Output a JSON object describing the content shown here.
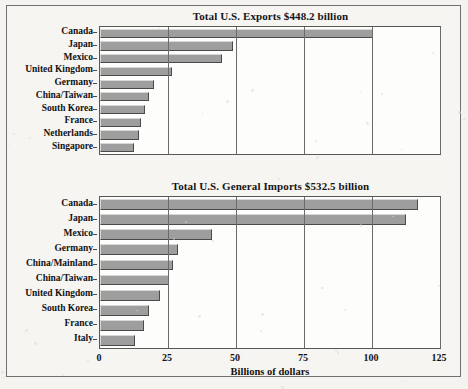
{
  "figure": {
    "x_axis_title": "Billions of dollars",
    "x_ticks": [
      "0",
      "25",
      "50",
      "75",
      "100",
      "125"
    ]
  },
  "chart_data": [
    {
      "type": "bar",
      "orientation": "horizontal",
      "title": "Total U.S. Exports $448.2 billion",
      "xlabel": "Billions of dollars",
      "ylabel": "",
      "xlim": [
        0,
        125
      ],
      "xticks": [
        0,
        25,
        50,
        75,
        100,
        125
      ],
      "grid": true,
      "legend": false,
      "categories": [
        "Canada",
        "Japan",
        "Mexico",
        "United Kingdom",
        "Germany",
        "China/Taiwan",
        "South Korea",
        "France",
        "Netherlands",
        "Singapore"
      ],
      "values": [
        100.2,
        49.0,
        45.0,
        26.5,
        20.0,
        18.0,
        16.5,
        15.0,
        14.5,
        12.5
      ]
    },
    {
      "type": "bar",
      "orientation": "horizontal",
      "title": "Total U.S. General Imports $532.5 billion",
      "xlabel": "Billions of dollars",
      "ylabel": "",
      "xlim": [
        0,
        125
      ],
      "xticks": [
        0,
        25,
        50,
        75,
        100,
        125
      ],
      "grid": true,
      "legend": false,
      "categories": [
        "Canada",
        "Japan",
        "Mexico",
        "Germany",
        "China/Mainland",
        "China/Taiwan",
        "United Kingdom",
        "South Korea",
        "France",
        "Italy"
      ],
      "values": [
        117.0,
        112.5,
        41.0,
        28.5,
        27.0,
        25.5,
        22.0,
        18.0,
        16.0,
        13.0
      ]
    }
  ]
}
